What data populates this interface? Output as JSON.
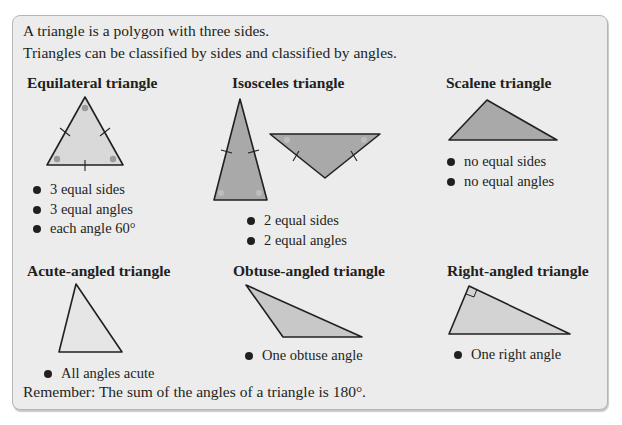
{
  "intro": {
    "line1": "A triangle is a polygon with three sides.",
    "line2": "Triangles can be classified by sides and classified by angles."
  },
  "sections": [
    {
      "title": "Equilateral triangle",
      "bullets": [
        "3 equal sides",
        "3 equal angles",
        "each angle 60°"
      ]
    },
    {
      "title": "Isosceles triangle",
      "bullets": [
        "2 equal sides",
        "2 equal angles"
      ]
    },
    {
      "title": "Scalene triangle",
      "bullets": [
        "no equal sides",
        "no equal angles"
      ]
    },
    {
      "title": "Acute-angled triangle",
      "bullets": [
        "All angles acute"
      ]
    },
    {
      "title": "Obtuse-angled triangle",
      "bullets": [
        "One obtuse angle"
      ]
    },
    {
      "title": "Right-angled triangle",
      "bullets": [
        "One right angle"
      ]
    }
  ],
  "remember": "Remember: The sum of the angles of a triangle is 180°.",
  "colors": {
    "panel_bg": "#ececec",
    "light_fill": "#d9d9d9",
    "dark_fill": "#a9a9a9",
    "stroke": "#231f20",
    "angle_mark": "#9a9a9a"
  }
}
